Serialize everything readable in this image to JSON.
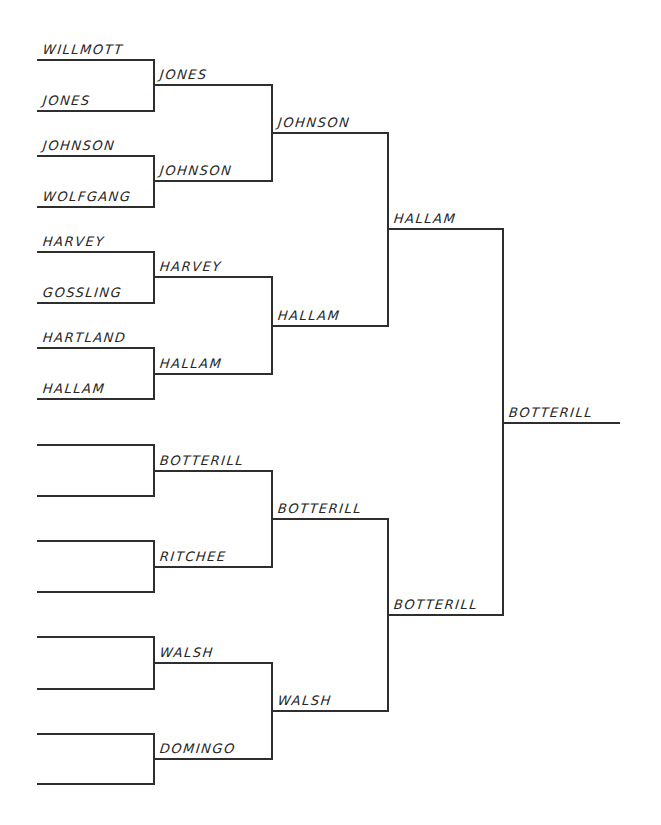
{
  "bracket": {
    "colors": {
      "line": "#2e2e2e",
      "text": "#262626",
      "background": "#ffffff"
    },
    "rounds": [
      {
        "name": "round-1",
        "x1": 37,
        "x2": 154,
        "slots": [
          {
            "y": 60,
            "name": "WILLMOTT"
          },
          {
            "y": 111,
            "name": "JONES"
          },
          {
            "y": 156,
            "name": "JOHNSON"
          },
          {
            "y": 207,
            "name": "WOLFGANG"
          },
          {
            "y": 252,
            "name": "HARVEY"
          },
          {
            "y": 303,
            "name": "GOSSLING"
          },
          {
            "y": 348,
            "name": "HARTLAND"
          },
          {
            "y": 399,
            "name": "HALLAM"
          },
          {
            "y": 445,
            "name": ""
          },
          {
            "y": 496,
            "name": ""
          },
          {
            "y": 541,
            "name": ""
          },
          {
            "y": 592,
            "name": ""
          },
          {
            "y": 637,
            "name": ""
          },
          {
            "y": 689,
            "name": ""
          },
          {
            "y": 734,
            "name": ""
          },
          {
            "y": 784,
            "name": ""
          }
        ]
      },
      {
        "name": "round-2",
        "x1": 154,
        "x2": 272,
        "slots": [
          {
            "y": 85,
            "name": "JONES"
          },
          {
            "y": 181,
            "name": "JOHNSON"
          },
          {
            "y": 277,
            "name": "HARVEY"
          },
          {
            "y": 374,
            "name": "HALLAM"
          },
          {
            "y": 471,
            "name": "BOTTERILL"
          },
          {
            "y": 567,
            "name": "RITCHEE"
          },
          {
            "y": 663,
            "name": "WALSH"
          },
          {
            "y": 759,
            "name": "DOMINGO"
          }
        ]
      },
      {
        "name": "round-3",
        "x1": 272,
        "x2": 388,
        "slots": [
          {
            "y": 133,
            "name": "JOHNSON"
          },
          {
            "y": 326,
            "name": "HALLAM"
          },
          {
            "y": 519,
            "name": "BOTTERILL"
          },
          {
            "y": 711,
            "name": "WALSH"
          }
        ]
      },
      {
        "name": "round-4",
        "x1": 388,
        "x2": 503,
        "slots": [
          {
            "y": 229,
            "name": "HALLAM"
          },
          {
            "y": 615,
            "name": "BOTTERILL"
          }
        ]
      },
      {
        "name": "final",
        "x1": 503,
        "x2": 619,
        "slots": [
          {
            "y": 423,
            "name": "BOTTERILL"
          }
        ]
      }
    ]
  }
}
